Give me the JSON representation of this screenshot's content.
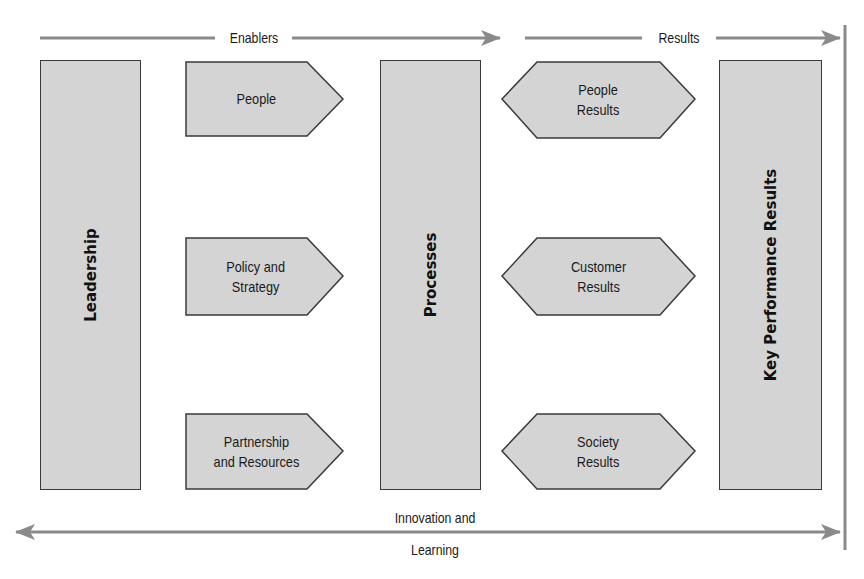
{
  "diagram": {
    "type": "EFQM Excellence Model",
    "flow_labels": {
      "enablers": "Enablers",
      "results": "Results",
      "innovation_line1": "Innovation and",
      "innovation_line2": "Learning"
    },
    "columns": {
      "leadership": "Leadership",
      "processes": "Processes",
      "key_performance_results": "Key Performance Results"
    },
    "enablers": [
      {
        "label": "People"
      },
      {
        "label": "Policy and\nStrategy"
      },
      {
        "label": "Partnership\nand Resources"
      }
    ],
    "results": [
      {
        "label": "People\nResults"
      },
      {
        "label": "Customer\nResults"
      },
      {
        "label": "Society\nResults"
      }
    ],
    "colors": {
      "box_fill": "#d4d4d4",
      "box_stroke": "#3a3a3a",
      "arrow": "#8a8a8a",
      "text": "#1a1a1a"
    }
  }
}
